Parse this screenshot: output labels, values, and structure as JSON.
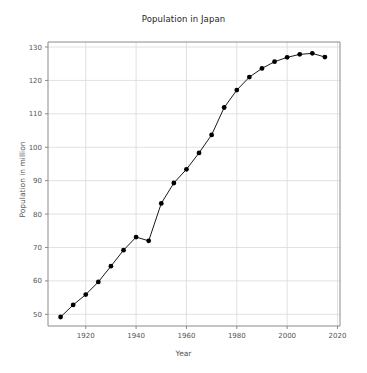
{
  "chart_data": {
    "type": "line",
    "title": "Population in Japan",
    "xlabel": "Year",
    "ylabel": "Population in million",
    "grid": true,
    "legend": "none",
    "marker": "circle-filled",
    "line_color": "#1a1a1a",
    "marker_color": "#000000",
    "xlim": [
      1905,
      2021
    ],
    "ylim": [
      46.5,
      131.5
    ],
    "xticks": [
      1920,
      1940,
      1960,
      1980,
      2000,
      2020
    ],
    "yticks": [
      50,
      60,
      70,
      80,
      90,
      100,
      110,
      120,
      130
    ],
    "x": [
      1910,
      1915,
      1920,
      1925,
      1930,
      1935,
      1940,
      1945,
      1950,
      1955,
      1960,
      1965,
      1970,
      1975,
      1980,
      1985,
      1990,
      1995,
      2000,
      2005,
      2010,
      2015
    ],
    "values": [
      49.2,
      52.8,
      55.9,
      59.7,
      64.4,
      69.2,
      73.1,
      72.0,
      83.2,
      89.3,
      93.4,
      98.3,
      103.7,
      111.9,
      117.1,
      121.0,
      123.6,
      125.6,
      126.9,
      127.8,
      128.1,
      127.0
    ],
    "series": [
      {
        "name": "Population in million",
        "values": [
          49.2,
          52.8,
          55.9,
          59.7,
          64.4,
          69.2,
          73.1,
          72.0,
          83.2,
          89.3,
          93.4,
          98.3,
          103.7,
          111.9,
          117.1,
          121.0,
          123.6,
          125.6,
          126.9,
          127.8,
          128.1,
          127.0
        ]
      }
    ]
  },
  "axes": {
    "x_tick_labels": [
      "1920",
      "1940",
      "1960",
      "1980",
      "2000",
      "2020"
    ],
    "y_tick_labels": [
      "50",
      "60",
      "70",
      "80",
      "90",
      "100",
      "110",
      "120",
      "130"
    ]
  }
}
